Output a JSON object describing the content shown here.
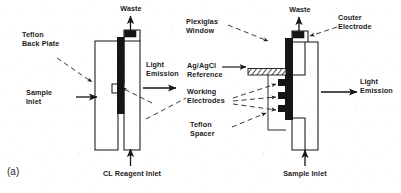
{
  "figure": {
    "panel_id": "(a)",
    "ink_color": "#151515",
    "background_color": "#ffffff"
  },
  "left_view": {
    "labels": {
      "waste": "Waste",
      "teflon_back_plate": "Teflon\nBack Plate",
      "light_emission": "Light\nEmission",
      "sample_inlet": "Sample\nInlet",
      "cl_reagent_inlet": "CL Reagent Inlet"
    }
  },
  "right_view": {
    "labels": {
      "waste": "Waste",
      "plexiglas_window": "Plexiglas\nWindow",
      "counter_electrode": "Couter\nElectrode",
      "ag_agcl_reference": "Ag/AgCl\nReference",
      "working_electrodes": "Working\nElectrodes",
      "teflon_spacer": "Teflon\nSpacer",
      "light_emission": "Light\nEmission",
      "sample_inlet": "Sample Inlet"
    }
  },
  "arrows": {
    "waste_left": "up-arrow",
    "waste_right": "up-arrow",
    "cl_reagent_inlet": "up-arrow",
    "sample_inlet_left": "right-arrow",
    "sample_inlet_right": "up-arrow",
    "light_emission_left": "right-arrow",
    "light_emission_right": "right-arrow",
    "reference_pointer": "right-arrow"
  }
}
